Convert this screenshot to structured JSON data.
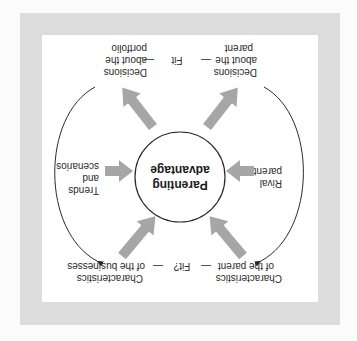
{
  "diagram": {
    "orientation": "rotated 180 degrees",
    "center": {
      "line1": "Parenting",
      "line2": "advantage"
    },
    "top_row": {
      "left": {
        "line1": "Characteristics",
        "line2": "of the parent"
      },
      "connector": "Fit?",
      "right": {
        "line1": "Characteristics",
        "line2": "of the businesses"
      }
    },
    "side_left": {
      "line1": "Rival",
      "line2": "parents"
    },
    "side_right": {
      "line1": "Trends",
      "line2": "and",
      "line3": "scenarios"
    },
    "bottom_row": {
      "left": {
        "line1": "Decisions",
        "line2": "about the",
        "line3": "parent"
      },
      "connector": "Fit",
      "right": {
        "line1": "Decisions",
        "line2": "about the",
        "line3": "portfolio"
      }
    },
    "dash": "—",
    "colors": {
      "frame": "#dcdcdc",
      "panel": "#ffffff",
      "arrow": "#a6a6a6",
      "line": "#2a2a2a",
      "text": "#2a2a2a"
    }
  }
}
